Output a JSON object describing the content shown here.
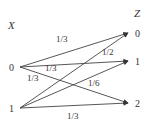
{
  "diagram": {
    "type": "bipartite-channel",
    "input_label": "X",
    "output_label": "Z",
    "inputs": [
      {
        "id": "x0",
        "label": "0"
      },
      {
        "id": "x1",
        "label": "1"
      }
    ],
    "outputs": [
      {
        "id": "z0",
        "label": "0"
      },
      {
        "id": "z1",
        "label": "1"
      },
      {
        "id": "z2",
        "label": "2"
      }
    ],
    "edges": [
      {
        "from": "x0",
        "to": "z0",
        "label": "1/3"
      },
      {
        "from": "x0",
        "to": "z1",
        "label": "1/3"
      },
      {
        "from": "x0",
        "to": "z2",
        "label": "1/3"
      },
      {
        "from": "x1",
        "to": "z0",
        "label": "1/2"
      },
      {
        "from": "x1",
        "to": "z1",
        "label": "1/6"
      },
      {
        "from": "x1",
        "to": "z2",
        "label": "1/3"
      }
    ],
    "colors": {
      "line": "#444444",
      "text": "#333333",
      "background": "#ffffff"
    }
  }
}
